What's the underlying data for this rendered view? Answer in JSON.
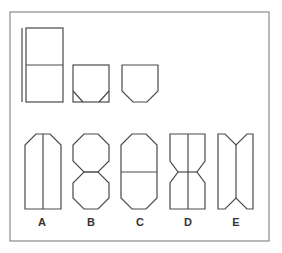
{
  "figure": {
    "colors": {
      "line": "#4a4a4a",
      "frame": "#8a8a8a",
      "background": "#ffffff"
    },
    "stimulus": [
      {
        "id": "sheet",
        "desc": "tall rectangle divided horizontally in half, with a vertical line to its left"
      },
      {
        "id": "folded",
        "desc": "square with small triangles in the bottom corners"
      },
      {
        "id": "cut",
        "desc": "square with bottom corners chamfered"
      }
    ],
    "options": [
      {
        "label": "A",
        "desc": "tall shape with chamfered top corners and a vertical center line"
      },
      {
        "label": "B",
        "desc": "two stacked octagons"
      },
      {
        "label": "C",
        "desc": "elongated octagon with horizontal center line"
      },
      {
        "label": "D",
        "desc": "hourglass shape with vertical center line"
      },
      {
        "label": "E",
        "desc": "rectangle with V-notches at top and bottom and a vertical center line"
      }
    ]
  }
}
